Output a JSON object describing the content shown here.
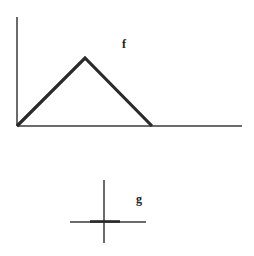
{
  "diagram": {
    "colors": {
      "background": "#ffffff",
      "stroke": "#2a2a2a",
      "thin_stroke": "#3a3a3a"
    },
    "plot_f": {
      "label": "f",
      "label_pos": [
        122,
        48
      ],
      "y_axis": {
        "x": 17,
        "y1": 17,
        "y2": 126
      },
      "x_axis": {
        "y": 126,
        "x1": 17,
        "x2": 242
      },
      "triangle_points": [
        [
          17,
          126
        ],
        [
          85,
          58
        ],
        [
          152,
          126
        ]
      ]
    },
    "plot_g": {
      "label": "g",
      "label_pos": [
        136,
        203
      ],
      "vertical_axis": {
        "x": 104,
        "y1": 180,
        "y2": 243
      },
      "horizontal_axis": {
        "y": 222,
        "x1": 70,
        "x2": 146
      },
      "pulse_segment": {
        "y": 222,
        "x1": 90,
        "x2": 120
      }
    }
  }
}
